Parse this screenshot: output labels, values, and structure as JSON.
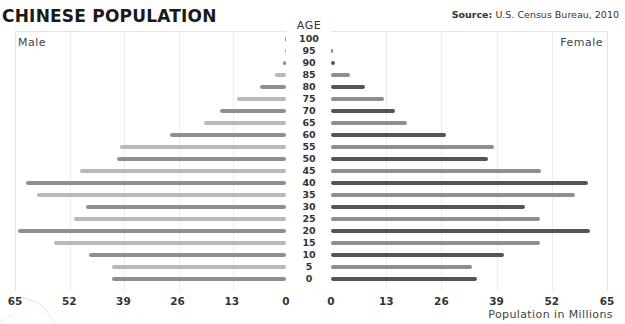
{
  "header": {
    "title": "CHINESE POPULATION",
    "source_label": "Source:",
    "source_text": "U.S. Census Bureau, 2010"
  },
  "labels": {
    "male": "Male",
    "female": "Female",
    "age_header": "AGE",
    "x_axis": "Population in Millions"
  },
  "colors": {
    "male_even": "#8e8e8e",
    "male_odd": "#b9b9b9",
    "female_even": "#545454",
    "female_odd": "#8e8e8e",
    "grid": "#ececec"
  },
  "chart_data": {
    "type": "bar",
    "orientation": "horizontal-population-pyramid",
    "title": "CHINESE POPULATION",
    "subtitle": "Source: U.S. Census Bureau, 2010",
    "xlabel": "Population in Millions",
    "ylabel": "AGE",
    "categories": [
      "100",
      "95",
      "90",
      "85",
      "80",
      "75",
      "70",
      "65",
      "60",
      "55",
      "50",
      "45",
      "40",
      "35",
      "30",
      "25",
      "20",
      "15",
      "10",
      "5",
      "0"
    ],
    "series": [
      {
        "name": "Male",
        "values": [
          0.3,
          0.2,
          0.8,
          2.6,
          6.2,
          11.7,
          15.8,
          19.6,
          27.8,
          39.8,
          40.5,
          49.4,
          62.3,
          59.7,
          48.0,
          50.8,
          64.3,
          55.6,
          47.2,
          41.7,
          41.7
        ]
      },
      {
        "name": "Female",
        "values": [
          0.0,
          0.3,
          1.0,
          4.5,
          8.0,
          12.5,
          15.1,
          18.0,
          27.2,
          38.3,
          36.9,
          49.4,
          60.5,
          57.4,
          45.6,
          49.2,
          61.0,
          49.2,
          40.7,
          33.1,
          34.5
        ]
      }
    ],
    "male_ticks": [
      "65",
      "52",
      "39",
      "26",
      "13",
      "0"
    ],
    "female_ticks": [
      "0",
      "13",
      "26",
      "39",
      "52",
      "65"
    ],
    "xlim": [
      0,
      65
    ],
    "grid": true,
    "legend": "side labels: Male (left), Female (right)"
  }
}
